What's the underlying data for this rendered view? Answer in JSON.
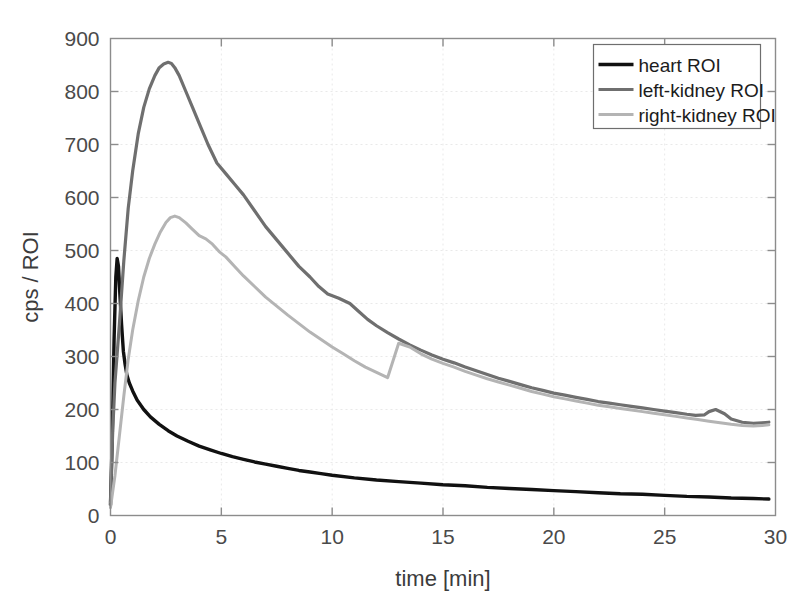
{
  "chart_data": {
    "type": "line",
    "title": "",
    "xlabel": "time [min]",
    "ylabel": "cps / ROI",
    "xlim": [
      0,
      30
    ],
    "ylim": [
      0,
      900
    ],
    "xticks": [
      0,
      5,
      10,
      15,
      20,
      25,
      30
    ],
    "yticks": [
      0,
      100,
      200,
      300,
      400,
      500,
      600,
      700,
      800,
      900
    ],
    "xtick_labels": [
      "0",
      "5",
      "10",
      "15",
      "20",
      "25",
      "30"
    ],
    "ytick_labels": [
      "0",
      "100",
      "200",
      "300",
      "400",
      "500",
      "600",
      "700",
      "800",
      "900"
    ],
    "grid": true,
    "legend_position": "top-right",
    "series": [
      {
        "name": "heart ROI",
        "color": "#111111",
        "width": 3.4,
        "x": [
          0.0,
          0.08,
          0.16,
          0.24,
          0.3,
          0.36,
          0.42,
          0.5,
          0.58,
          0.66,
          0.74,
          0.85,
          1.0,
          1.2,
          1.5,
          1.8,
          2.2,
          2.6,
          3.0,
          3.5,
          4.0,
          4.5,
          5.0,
          5.5,
          6.0,
          6.5,
          7.0,
          7.5,
          8.0,
          8.5,
          9.0,
          9.5,
          10.0,
          11.0,
          12.0,
          13.0,
          14.0,
          15.0,
          16.0,
          17.0,
          18.0,
          19.0,
          20.0,
          21.0,
          22.0,
          23.0,
          24.0,
          25.0,
          26.0,
          27.0,
          28.0,
          29.0,
          29.7
        ],
        "y": [
          20,
          150,
          330,
          450,
          485,
          470,
          420,
          360,
          310,
          285,
          265,
          250,
          235,
          218,
          200,
          186,
          172,
          160,
          150,
          140,
          131,
          124,
          117,
          111,
          106,
          101,
          97,
          93,
          89,
          85,
          82,
          79,
          76,
          71,
          67,
          64,
          61,
          58,
          56,
          53,
          51,
          49,
          47,
          45,
          43,
          41,
          40,
          38,
          36,
          35,
          33,
          32,
          31
        ]
      },
      {
        "name": "left-kidney ROI",
        "color": "#6f6f6f",
        "width": 3.2,
        "x": [
          0.0,
          0.1,
          0.2,
          0.3,
          0.4,
          0.5,
          0.6,
          0.8,
          1.0,
          1.25,
          1.5,
          1.75,
          2.0,
          2.2,
          2.4,
          2.6,
          2.75,
          2.9,
          3.1,
          3.4,
          3.7,
          4.0,
          4.4,
          4.8,
          5.2,
          5.6,
          6.0,
          6.5,
          7.0,
          7.5,
          8.0,
          8.5,
          9.0,
          9.4,
          9.8,
          10.3,
          10.8,
          11.2,
          11.6,
          12.0,
          12.5,
          13.0,
          13.5,
          14.0,
          14.5,
          15.0,
          15.5,
          16.0,
          16.5,
          17.0,
          17.5,
          18.0,
          18.5,
          19.0,
          19.5,
          20.0,
          20.5,
          21.0,
          21.5,
          22.0,
          22.5,
          23.0,
          23.5,
          24.0,
          24.5,
          25.0,
          25.5,
          26.0,
          26.4,
          26.8,
          27.0,
          27.3,
          27.7,
          28.0,
          28.5,
          29.0,
          29.4,
          29.7
        ],
        "y": [
          25,
          160,
          250,
          305,
          360,
          420,
          480,
          580,
          650,
          720,
          770,
          805,
          830,
          845,
          852,
          855,
          853,
          845,
          830,
          800,
          770,
          740,
          700,
          665,
          645,
          625,
          605,
          575,
          545,
          520,
          495,
          470,
          450,
          432,
          418,
          410,
          400,
          385,
          370,
          358,
          345,
          333,
          322,
          312,
          303,
          295,
          288,
          280,
          273,
          266,
          259,
          253,
          247,
          241,
          236,
          231,
          227,
          223,
          219,
          215,
          212,
          209,
          206,
          203,
          200,
          197,
          194,
          191,
          189,
          190,
          196,
          200,
          192,
          182,
          176,
          174,
          175,
          176
        ]
      },
      {
        "name": "right-kidney ROI",
        "color": "#b4b4b4",
        "width": 3.0,
        "x": [
          0.0,
          0.2,
          0.4,
          0.6,
          0.8,
          1.0,
          1.25,
          1.5,
          1.75,
          2.0,
          2.25,
          2.5,
          2.7,
          2.9,
          3.1,
          3.4,
          3.7,
          4.0,
          4.3,
          4.6,
          4.9,
          5.2,
          5.6,
          6.0,
          6.5,
          7.0,
          7.5,
          8.0,
          8.5,
          9.0,
          9.5,
          10.0,
          10.5,
          11.0,
          11.5,
          12.0,
          12.5,
          13.0,
          13.5,
          14.0,
          14.5,
          15.0,
          15.5,
          16.0,
          16.5,
          17.0,
          17.5,
          18.0,
          18.5,
          19.0,
          19.5,
          20.0,
          20.5,
          21.0,
          21.5,
          22.0,
          22.5,
          23.0,
          23.5,
          24.0,
          24.5,
          25.0,
          25.5,
          26.0,
          26.5,
          27.0,
          27.5,
          28.0,
          28.5,
          29.0,
          29.4,
          29.7
        ],
        "y": [
          15,
          75,
          150,
          225,
          295,
          350,
          405,
          450,
          485,
          512,
          535,
          553,
          562,
          565,
          562,
          552,
          540,
          528,
          522,
          512,
          498,
          488,
          470,
          452,
          432,
          412,
          395,
          378,
          362,
          346,
          332,
          318,
          305,
          292,
          280,
          270,
          260,
          325,
          318,
          305,
          295,
          287,
          280,
          272,
          265,
          258,
          252,
          246,
          240,
          234,
          229,
          224,
          220,
          216,
          212,
          208,
          205,
          202,
          199,
          196,
          193,
          190,
          187,
          184,
          181,
          178,
          175,
          172,
          170,
          169,
          170,
          171
        ]
      }
    ]
  },
  "legend": {
    "entries": [
      {
        "label": "heart ROI"
      },
      {
        "label": "left-kidney ROI"
      },
      {
        "label": "right-kidney ROI"
      }
    ]
  }
}
